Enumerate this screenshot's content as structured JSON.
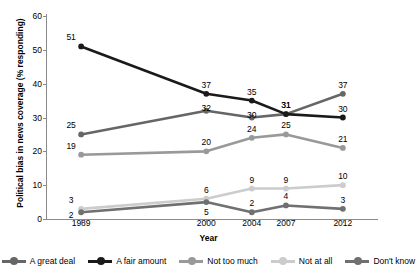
{
  "chart_data": {
    "type": "line",
    "title": "",
    "xlabel": "Year",
    "ylabel": "Political bias in news coverage (% responding)",
    "x": [
      1989,
      2000,
      2004,
      2007,
      2012
    ],
    "categories": [
      "1989",
      "2000",
      "2004",
      "2007",
      "2012"
    ],
    "ylim": [
      0,
      60
    ],
    "yticks": [
      0,
      10,
      20,
      30,
      40,
      50,
      60
    ],
    "xlim": [
      1986,
      2015
    ],
    "grid": false,
    "legend_position": "bottom",
    "data_labels": true,
    "series": [
      {
        "name": "A great deal",
        "color": "#666666",
        "values": [
          25,
          32,
          30,
          31,
          37
        ],
        "labels": [
          "25",
          "32",
          "30",
          "31",
          "37"
        ]
      },
      {
        "name": "A fair amount",
        "color": "#1a1a1a",
        "values": [
          51,
          37,
          35,
          31,
          30
        ],
        "labels": [
          "51",
          "37",
          "35",
          "31",
          "30"
        ]
      },
      {
        "name": "Not too much",
        "color": "#999999",
        "values": [
          19,
          20,
          24,
          25,
          21
        ],
        "labels": [
          "19",
          "20",
          "24",
          "25",
          "21"
        ]
      },
      {
        "name": "Not at all",
        "color": "#cccccc",
        "values": [
          3,
          6,
          9,
          9,
          10
        ],
        "labels": [
          "3",
          "6",
          "9",
          "9",
          "10"
        ]
      },
      {
        "name": "Don't know",
        "color": "#707070",
        "values": [
          2,
          5,
          2,
          4,
          3
        ],
        "labels": [
          "2",
          "5",
          "2",
          "4",
          "3"
        ]
      }
    ]
  },
  "axis": {
    "y_title": "Political bias in news coverage (% responding)",
    "x_title": "Year",
    "y_tick_labels": [
      "0",
      "10",
      "20",
      "30",
      "40",
      "50",
      "60"
    ],
    "x_tick_labels": [
      "1989",
      "2000",
      "2004",
      "2007",
      "2012"
    ]
  },
  "legend": {
    "items": [
      {
        "label": "A great deal",
        "color": "#666666"
      },
      {
        "label": "A fair amount",
        "color": "#1a1a1a"
      },
      {
        "label": "Not too much",
        "color": "#999999"
      },
      {
        "label": "Not at all",
        "color": "#cccccc"
      },
      {
        "label": "Don't know",
        "color": "#707070"
      }
    ]
  }
}
